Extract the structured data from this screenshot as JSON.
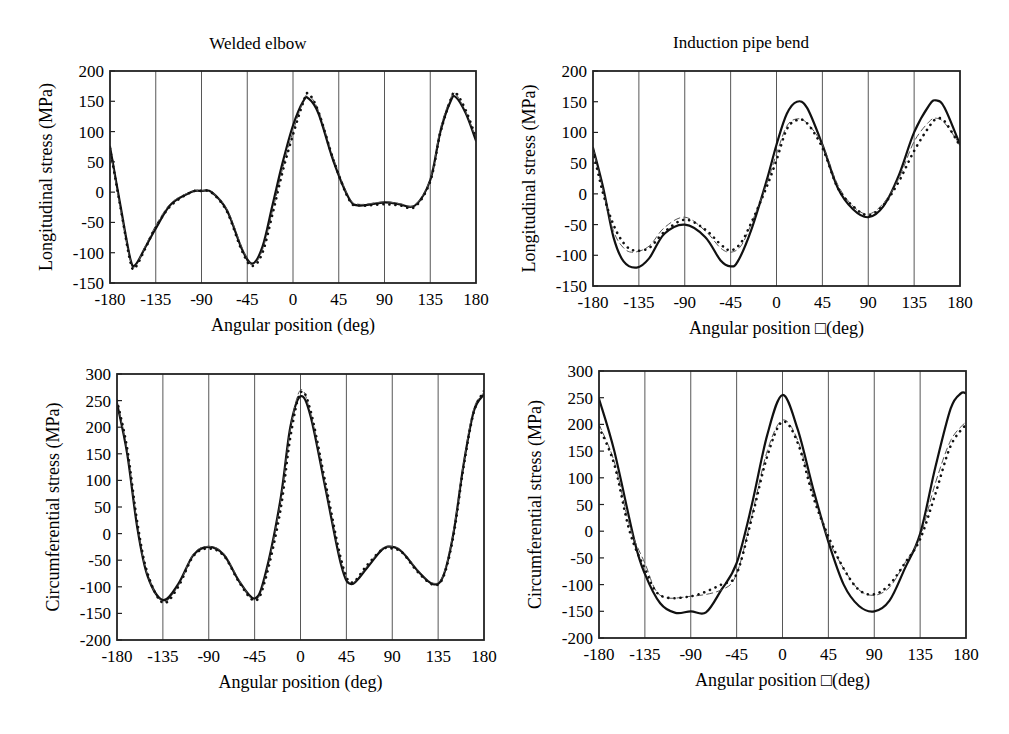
{
  "figure": {
    "column_titles": [
      "Welded elbow",
      "Induction pipe bend"
    ]
  },
  "chart_data": [
    {
      "id": "welded-longitudinal",
      "type": "line",
      "title": "Welded elbow",
      "xlabel": "Angular position (deg)",
      "ylabel": "Longitudinal stress (MPa)",
      "xlim": [
        -180,
        180
      ],
      "ylim": [
        -150,
        200
      ],
      "xticks": [
        -180,
        -135,
        -90,
        -45,
        0,
        45,
        90,
        135,
        180
      ],
      "yticks": [
        -150,
        -100,
        -50,
        0,
        50,
        100,
        150,
        200
      ],
      "grid": "vertical",
      "frame": {
        "x0": 110,
        "y0": 71,
        "x1": 476,
        "y1": 283
      },
      "series": [
        {
          "name": "solid",
          "style": "solid",
          "x": [
            -180,
            -170,
            -160,
            -155,
            -145,
            -135,
            -120,
            -100,
            -90,
            -80,
            -65,
            -50,
            -40,
            -30,
            -20,
            -10,
            0,
            10,
            15,
            25,
            40,
            55,
            65,
            90,
            105,
            120,
            135,
            145,
            155,
            160,
            170,
            180
          ],
          "y": [
            75,
            -20,
            -110,
            -120,
            -90,
            -60,
            -20,
            0,
            2,
            0,
            -30,
            -95,
            -118,
            -90,
            -20,
            50,
            110,
            150,
            155,
            130,
            50,
            -10,
            -22,
            -17,
            -20,
            -22,
            20,
            100,
            150,
            157,
            130,
            85
          ]
        },
        {
          "name": "dashed",
          "style": "dashed",
          "x": [
            -180,
            -170,
            -160,
            -155,
            -145,
            -135,
            -120,
            -100,
            -90,
            -80,
            -65,
            -50,
            -40,
            -30,
            -20,
            -10,
            0,
            10,
            15,
            25,
            40,
            55,
            65,
            90,
            105,
            120,
            135,
            145,
            155,
            160,
            170,
            180
          ],
          "y": [
            70,
            -25,
            -112,
            -122,
            -88,
            -55,
            -18,
            1,
            2,
            0,
            -28,
            -92,
            -120,
            -95,
            -30,
            40,
            100,
            150,
            160,
            135,
            55,
            -8,
            -20,
            -16,
            -19,
            -21,
            22,
            105,
            155,
            162,
            132,
            88
          ]
        },
        {
          "name": "dotted",
          "style": "dotted",
          "x": [
            -180,
            -170,
            -160,
            -155,
            -145,
            -135,
            -120,
            -100,
            -90,
            -80,
            -65,
            -50,
            -40,
            -30,
            -20,
            -10,
            0,
            10,
            15,
            25,
            40,
            55,
            65,
            90,
            105,
            120,
            135,
            145,
            155,
            160,
            170,
            180
          ],
          "y": [
            72,
            -22,
            -115,
            -124,
            -92,
            -58,
            -22,
            0,
            2,
            -1,
            -32,
            -98,
            -122,
            -100,
            -35,
            35,
            95,
            148,
            163,
            133,
            52,
            -12,
            -22,
            -20,
            -22,
            -24,
            18,
            98,
            152,
            164,
            135,
            90
          ]
        }
      ]
    },
    {
      "id": "induction-longitudinal",
      "type": "line",
      "title": "Induction pipe bend",
      "xlabel": "Angular position □(deg)",
      "ylabel": "Longitudinal stress (MPa)",
      "xlim": [
        -180,
        180
      ],
      "ylim": [
        -150,
        200
      ],
      "xticks": [
        -180,
        -135,
        -90,
        -45,
        0,
        45,
        90,
        135,
        180
      ],
      "yticks": [
        -150,
        -100,
        -50,
        0,
        50,
        100,
        150,
        200
      ],
      "grid": "vertical",
      "frame": {
        "x0": 593,
        "y0": 71,
        "x1": 960,
        "y1": 286
      },
      "series": [
        {
          "name": "solid",
          "style": "solid",
          "x": [
            -180,
            -170,
            -160,
            -150,
            -137,
            -125,
            -110,
            -90,
            -70,
            -55,
            -45,
            -38,
            -25,
            -10,
            0,
            10,
            20,
            30,
            45,
            60,
            75,
            90,
            105,
            120,
            135,
            150,
            157,
            165,
            180
          ],
          "y": [
            75,
            10,
            -70,
            -110,
            -120,
            -105,
            -65,
            -50,
            -70,
            -108,
            -118,
            -110,
            -60,
            20,
            80,
            130,
            150,
            140,
            80,
            10,
            -25,
            -38,
            -20,
            30,
            100,
            145,
            152,
            140,
            80
          ]
        },
        {
          "name": "dashed",
          "style": "dashed",
          "x": [
            -180,
            -170,
            -160,
            -150,
            -140,
            -125,
            -110,
            -90,
            -70,
            -55,
            -45,
            -35,
            -25,
            -10,
            0,
            10,
            20,
            30,
            45,
            60,
            75,
            90,
            105,
            120,
            135,
            150,
            157,
            165,
            180
          ],
          "y": [
            75,
            5,
            -60,
            -88,
            -95,
            -85,
            -55,
            -38,
            -60,
            -88,
            -95,
            -85,
            -50,
            15,
            65,
            110,
            122,
            115,
            80,
            15,
            -20,
            -33,
            -15,
            25,
            85,
            118,
            123,
            115,
            80
          ]
        },
        {
          "name": "dotted",
          "style": "dotted",
          "x": [
            -180,
            -170,
            -160,
            -150,
            -140,
            -125,
            -110,
            -90,
            -70,
            -55,
            -45,
            -35,
            -25,
            -10,
            0,
            10,
            20,
            30,
            45,
            60,
            75,
            90,
            105,
            120,
            135,
            150,
            157,
            165,
            180
          ],
          "y": [
            70,
            0,
            -50,
            -80,
            -92,
            -88,
            -62,
            -42,
            -58,
            -82,
            -92,
            -80,
            -48,
            10,
            55,
            105,
            120,
            115,
            75,
            10,
            -20,
            -35,
            -18,
            20,
            70,
            110,
            122,
            118,
            78
          ]
        }
      ]
    },
    {
      "id": "welded-circumferential",
      "type": "line",
      "title": "Welded elbow",
      "xlabel": "Angular position (deg)",
      "ylabel": "Circumferential stress (MPa)",
      "xlim": [
        -180,
        180
      ],
      "ylim": [
        -200,
        300
      ],
      "xticks": [
        -180,
        -135,
        -90,
        -45,
        0,
        45,
        90,
        135,
        180
      ],
      "yticks": [
        -200,
        -150,
        -100,
        -50,
        0,
        50,
        100,
        150,
        200,
        250,
        300
      ],
      "grid": "vertical",
      "frame": {
        "x0": 117,
        "y0": 374,
        "x1": 484,
        "y1": 640
      },
      "series": [
        {
          "name": "solid",
          "style": "solid",
          "x": [
            -180,
            -170,
            -160,
            -150,
            -135,
            -120,
            -105,
            -90,
            -75,
            -60,
            -45,
            -35,
            -20,
            -10,
            0,
            10,
            25,
            40,
            50,
            65,
            80,
            90,
            100,
            115,
            130,
            140,
            150,
            160,
            170,
            180
          ],
          "y": [
            245,
            150,
            10,
            -80,
            -125,
            -95,
            -40,
            -25,
            -40,
            -90,
            -122,
            -80,
            60,
            200,
            258,
            220,
            80,
            -60,
            -95,
            -65,
            -30,
            -25,
            -35,
            -70,
            -95,
            -80,
            0,
            130,
            230,
            262
          ]
        },
        {
          "name": "dashed",
          "style": "dashed",
          "x": [
            -180,
            -170,
            -160,
            -150,
            -135,
            -120,
            -105,
            -90,
            -75,
            -60,
            -45,
            -35,
            -20,
            -10,
            0,
            10,
            25,
            40,
            50,
            65,
            80,
            90,
            100,
            115,
            130,
            140,
            150,
            160,
            170,
            180
          ],
          "y": [
            248,
            155,
            15,
            -78,
            -128,
            -98,
            -38,
            -24,
            -38,
            -88,
            -125,
            -85,
            55,
            195,
            270,
            225,
            85,
            -55,
            -93,
            -62,
            -28,
            -24,
            -33,
            -68,
            -93,
            -78,
            5,
            135,
            235,
            265
          ]
        },
        {
          "name": "dotted",
          "style": "dotted",
          "x": [
            -180,
            -170,
            -160,
            -150,
            -135,
            -120,
            -105,
            -90,
            -75,
            -60,
            -45,
            -35,
            -20,
            -10,
            0,
            10,
            25,
            40,
            50,
            65,
            80,
            90,
            100,
            115,
            130,
            140,
            150,
            160,
            170,
            180
          ],
          "y": [
            250,
            160,
            20,
            -75,
            -130,
            -100,
            -42,
            -28,
            -42,
            -92,
            -126,
            -90,
            40,
            180,
            265,
            230,
            90,
            -50,
            -92,
            -60,
            -30,
            -28,
            -36,
            -72,
            -96,
            -82,
            -5,
            125,
            228,
            268
          ]
        }
      ]
    },
    {
      "id": "induction-circumferential",
      "type": "line",
      "title": "Induction pipe bend",
      "xlabel": "Angular position □(deg)",
      "ylabel": "Circumferential stress (MPa)",
      "xlim": [
        -180,
        180
      ],
      "ylim": [
        -200,
        300
      ],
      "xticks": [
        -180,
        -135,
        -90,
        -45,
        0,
        45,
        90,
        135,
        180
      ],
      "yticks": [
        -200,
        -150,
        -100,
        -50,
        0,
        50,
        100,
        150,
        200,
        250,
        300
      ],
      "grid": "vertical",
      "frame": {
        "x0": 599,
        "y0": 371,
        "x1": 966,
        "y1": 638
      },
      "series": [
        {
          "name": "solid",
          "style": "solid",
          "x": [
            -180,
            -165,
            -145,
            -135,
            -120,
            -105,
            -90,
            -75,
            -60,
            -45,
            -30,
            -15,
            0,
            15,
            30,
            45,
            60,
            75,
            90,
            105,
            120,
            135,
            150,
            165,
            175,
            180
          ],
          "y": [
            248,
            150,
            -20,
            -80,
            -135,
            -153,
            -150,
            -152,
            -110,
            -60,
            50,
            180,
            255,
            190,
            80,
            -20,
            -100,
            -140,
            -150,
            -130,
            -70,
            -5,
            120,
            230,
            258,
            258
          ]
        },
        {
          "name": "dashed",
          "style": "dashed",
          "x": [
            -180,
            -165,
            -150,
            -135,
            -120,
            -90,
            -60,
            -45,
            -30,
            -15,
            0,
            15,
            30,
            45,
            60,
            75,
            90,
            105,
            120,
            135,
            150,
            165,
            180
          ],
          "y": [
            200,
            130,
            10,
            -60,
            -120,
            -122,
            -110,
            -80,
            30,
            150,
            208,
            170,
            70,
            -15,
            -70,
            -110,
            -120,
            -105,
            -60,
            -10,
            90,
            170,
            205
          ]
        },
        {
          "name": "dotted",
          "style": "dotted",
          "x": [
            -180,
            -165,
            -150,
            -135,
            -120,
            -90,
            -60,
            -45,
            -30,
            -15,
            0,
            15,
            30,
            45,
            60,
            75,
            90,
            105,
            120,
            135,
            150,
            165,
            180
          ],
          "y": [
            195,
            125,
            0,
            -70,
            -120,
            -122,
            -100,
            -80,
            25,
            140,
            205,
            165,
            65,
            -10,
            -70,
            -110,
            -118,
            -100,
            -60,
            -15,
            70,
            160,
            200
          ]
        }
      ]
    }
  ]
}
